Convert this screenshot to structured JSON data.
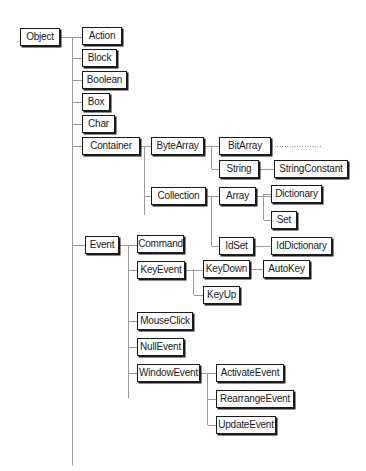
{
  "diagram": {
    "type": "class-hierarchy",
    "colors": {
      "line": "#9a9a9a",
      "box_border": "#1a1a1a",
      "background": "#ffffff"
    },
    "nodes": [
      {
        "id": "Object",
        "label": "Object",
        "parent": null,
        "x": 20,
        "y": 28,
        "w": 40
      },
      {
        "id": "Action",
        "label": "Action",
        "parent": "Object",
        "x": 82,
        "y": 27,
        "w": 40
      },
      {
        "id": "Block",
        "label": "Block",
        "parent": "Object",
        "x": 82,
        "y": 49,
        "w": 35
      },
      {
        "id": "Boolean",
        "label": "Boolean",
        "parent": "Object",
        "x": 82,
        "y": 71,
        "w": 45
      },
      {
        "id": "Box",
        "label": "Box",
        "parent": "Object",
        "x": 82,
        "y": 93,
        "w": 28
      },
      {
        "id": "Char",
        "label": "Char",
        "parent": "Object",
        "x": 82,
        "y": 115,
        "w": 33
      },
      {
        "id": "Container",
        "label": "Container",
        "parent": "Object",
        "x": 82,
        "y": 137,
        "w": 58
      },
      {
        "id": "ByteArray",
        "label": "ByteArray",
        "parent": "Container",
        "x": 151,
        "y": 137,
        "w": 53
      },
      {
        "id": "BitArray",
        "label": "BitArray",
        "parent": "ByteArray",
        "x": 219,
        "y": 137,
        "w": 52
      },
      {
        "id": "String",
        "label": "String",
        "parent": "ByteArray",
        "x": 219,
        "y": 160,
        "w": 40
      },
      {
        "id": "StringConstant",
        "label": "StringConstant",
        "parent": "String",
        "x": 274,
        "y": 160,
        "w": 74
      },
      {
        "id": "Collection",
        "label": "Collection",
        "parent": "Container",
        "x": 151,
        "y": 187,
        "w": 55
      },
      {
        "id": "Array",
        "label": "Array",
        "parent": "Collection",
        "x": 219,
        "y": 187,
        "w": 37
      },
      {
        "id": "Dictionary",
        "label": "Dictionary",
        "parent": "Array",
        "x": 271,
        "y": 185,
        "w": 51
      },
      {
        "id": "Set",
        "label": "Set",
        "parent": "Array",
        "x": 271,
        "y": 211,
        "w": 26
      },
      {
        "id": "IdSet",
        "label": "IdSet",
        "parent": "Collection",
        "x": 219,
        "y": 237,
        "w": 35
      },
      {
        "id": "IdDictionary",
        "label": "IdDictionary",
        "parent": "IdSet",
        "x": 271,
        "y": 237,
        "w": 61
      },
      {
        "id": "Event",
        "label": "Event",
        "parent": "Object",
        "x": 85,
        "y": 236,
        "w": 34
      },
      {
        "id": "Command",
        "label": "Command",
        "parent": "Event",
        "x": 137,
        "y": 235,
        "w": 47
      },
      {
        "id": "KeyEvent",
        "label": "KeyEvent",
        "parent": "Event",
        "x": 137,
        "y": 261,
        "w": 48
      },
      {
        "id": "KeyDown",
        "label": "KeyDown",
        "parent": "KeyEvent",
        "x": 203,
        "y": 260,
        "w": 47
      },
      {
        "id": "AutoKey",
        "label": "AutoKey",
        "parent": "KeyDown",
        "x": 263,
        "y": 260,
        "w": 47
      },
      {
        "id": "KeyUp",
        "label": "KeyUp",
        "parent": "KeyEvent",
        "x": 203,
        "y": 286,
        "w": 37
      },
      {
        "id": "MouseClick",
        "label": "MouseClick",
        "parent": "Event",
        "x": 137,
        "y": 312,
        "w": 56
      },
      {
        "id": "NullEvent",
        "label": "NullEvent",
        "parent": "Event",
        "x": 137,
        "y": 338,
        "w": 47
      },
      {
        "id": "WindowEvent",
        "label": "WindowEvent",
        "parent": "Event",
        "x": 137,
        "y": 364,
        "w": 63
      },
      {
        "id": "ActivateEvent",
        "label": "ActivateEvent",
        "parent": "WindowEvent",
        "x": 216,
        "y": 364,
        "w": 68
      },
      {
        "id": "RearrangeEvent",
        "label": "RearrangeEvent",
        "parent": "WindowEvent",
        "x": 216,
        "y": 390,
        "w": 78
      },
      {
        "id": "UpdateEvent",
        "label": "UpdateEvent",
        "parent": "WindowEvent",
        "x": 216,
        "y": 416,
        "w": 60
      }
    ],
    "continuation": {
      "from": "BitArray",
      "style": "dotted",
      "x1": 272,
      "x2": 322,
      "y": 146
    }
  }
}
